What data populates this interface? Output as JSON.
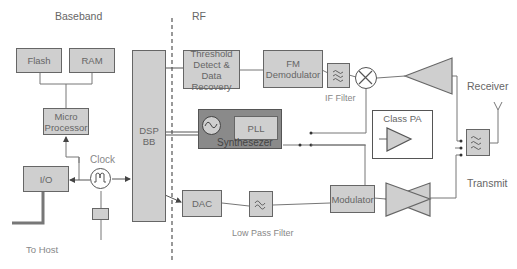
{
  "sections": {
    "baseband": "Baseband",
    "rf": "RF"
  },
  "blocks": {
    "flash": "Flash",
    "ram": "RAM",
    "micro_line1": "Micro",
    "micro_line2": "Processor",
    "io": "I/O",
    "dsp_line1": "DSP",
    "dsp_line2": "BB",
    "threshold_line1": "Threshold",
    "threshold_line2": "Detect & Data",
    "threshold_line3": "Recovery",
    "fm_line1": "FM",
    "fm_line2": "Demodulator",
    "pll": "PLL",
    "synthesizer": "Synthesezer",
    "class_pa": "Class PA",
    "dac": "DAC",
    "modulator": "Modulator"
  },
  "labels": {
    "clock": "Clock",
    "if_filter": "IF Filter",
    "low_pass_filter": "Low Pass Filter",
    "receiver": "Receiver",
    "transmit": "Transmit",
    "to_host": "To Host"
  },
  "colors": {
    "block_fill": "#cfcfcf",
    "synth_fill": "#8a8a8a",
    "border": "#666666",
    "text": "#666666"
  }
}
